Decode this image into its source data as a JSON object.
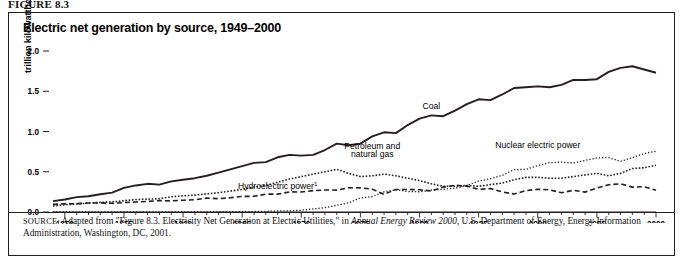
{
  "figure": {
    "label": "FIGURE 8.3",
    "title": "Electric net generation by source, 1949–2000"
  },
  "source": {
    "prefix": "SOURCE:",
    "text_before_italic": " Adapted from \"Figure 8.3. Electricity Net Generation at Electric Utilities,\" in ",
    "italic_title": "Annual Energy Review 2000",
    "text_after_italic": ", U.S. Department of Energy, Energy Information Administration, Washington, DC, 2001."
  },
  "chart_data": {
    "type": "line",
    "title": "Electric net generation by source, 1949–2000",
    "xlabel": "",
    "ylabel": "trillion kilowatthours",
    "xlim": [
      1949,
      2000
    ],
    "ylim": [
      0.0,
      2.0
    ],
    "xticks": [
      1950,
      1955,
      1960,
      1965,
      1970,
      1975,
      1980,
      1985,
      1990,
      1995,
      2000
    ],
    "xtick_labels": [
      "1950",
      "1955",
      "1960",
      "1965",
      "1970",
      "1975",
      "1980",
      "1985",
      "1990",
      "1995",
      "2000"
    ],
    "minor_tick_interval": 1,
    "yticks": [
      0.0,
      0.5,
      1.0,
      1.5,
      2.0
    ],
    "ytick_labels": [
      "0.0",
      "0.5",
      "1.0",
      "1.5",
      "2.0"
    ],
    "grid": false,
    "legend_position": "inline-annotations",
    "footnote_marker": "1",
    "x": [
      1949,
      1950,
      1951,
      1952,
      1953,
      1954,
      1955,
      1956,
      1957,
      1958,
      1959,
      1960,
      1961,
      1962,
      1963,
      1964,
      1965,
      1966,
      1967,
      1968,
      1969,
      1970,
      1971,
      1972,
      1973,
      1974,
      1975,
      1976,
      1977,
      1978,
      1979,
      1980,
      1981,
      1982,
      1983,
      1984,
      1985,
      1986,
      1987,
      1988,
      1989,
      1990,
      1991,
      1992,
      1993,
      1994,
      1995,
      1996,
      1997,
      1998,
      1999,
      2000
    ],
    "series": [
      {
        "name": "Coal",
        "label": "Coal",
        "line_style": "solid",
        "color": "#231f20",
        "values": [
          0.135,
          0.155,
          0.185,
          0.195,
          0.22,
          0.24,
          0.3,
          0.33,
          0.35,
          0.34,
          0.38,
          0.4,
          0.42,
          0.45,
          0.49,
          0.53,
          0.57,
          0.61,
          0.62,
          0.68,
          0.71,
          0.7,
          0.71,
          0.77,
          0.85,
          0.83,
          0.85,
          0.94,
          0.99,
          0.98,
          1.08,
          1.16,
          1.2,
          1.19,
          1.26,
          1.34,
          1.4,
          1.39,
          1.46,
          1.54,
          1.55,
          1.56,
          1.55,
          1.58,
          1.64,
          1.64,
          1.65,
          1.74,
          1.79,
          1.81,
          1.77,
          1.73
        ]
      },
      {
        "name": "Petroleum and natural gas",
        "label": "Petroleum and natural gas",
        "line_style": "dotted",
        "color": "#231f20",
        "values": [
          0.075,
          0.09,
          0.1,
          0.11,
          0.12,
          0.125,
          0.14,
          0.155,
          0.16,
          0.165,
          0.19,
          0.2,
          0.21,
          0.225,
          0.24,
          0.26,
          0.28,
          0.31,
          0.33,
          0.37,
          0.41,
          0.44,
          0.47,
          0.5,
          0.53,
          0.48,
          0.44,
          0.45,
          0.47,
          0.45,
          0.42,
          0.39,
          0.35,
          0.32,
          0.32,
          0.33,
          0.32,
          0.34,
          0.36,
          0.4,
          0.43,
          0.43,
          0.42,
          0.42,
          0.44,
          0.46,
          0.48,
          0.45,
          0.48,
          0.54,
          0.55,
          0.58
        ]
      },
      {
        "name": "Hydroelectric power",
        "label": "Hydroelectric power",
        "line_style": "dashed",
        "color": "#231f20",
        "values": [
          0.095,
          0.101,
          0.104,
          0.111,
          0.113,
          0.108,
          0.117,
          0.125,
          0.131,
          0.142,
          0.138,
          0.146,
          0.153,
          0.172,
          0.166,
          0.177,
          0.194,
          0.195,
          0.222,
          0.222,
          0.25,
          0.248,
          0.266,
          0.273,
          0.272,
          0.301,
          0.3,
          0.284,
          0.22,
          0.28,
          0.28,
          0.276,
          0.261,
          0.309,
          0.332,
          0.321,
          0.281,
          0.291,
          0.25,
          0.223,
          0.266,
          0.283,
          0.276,
          0.24,
          0.269,
          0.247,
          0.297,
          0.339,
          0.35,
          0.309,
          0.314,
          0.271
        ]
      },
      {
        "name": "Nuclear electric power",
        "label": "Nuclear electric power",
        "line_style": "fine-dotted",
        "color": "#231f20",
        "values": [
          0.0,
          0.0,
          0.0,
          0.0,
          0.0,
          0.0,
          0.0,
          0.0,
          0.0,
          0.0,
          0.0,
          0.001,
          0.002,
          0.002,
          0.003,
          0.003,
          0.004,
          0.006,
          0.008,
          0.013,
          0.014,
          0.022,
          0.038,
          0.054,
          0.083,
          0.114,
          0.173,
          0.191,
          0.251,
          0.276,
          0.255,
          0.251,
          0.273,
          0.283,
          0.294,
          0.328,
          0.384,
          0.414,
          0.455,
          0.527,
          0.529,
          0.577,
          0.613,
          0.619,
          0.61,
          0.64,
          0.673,
          0.675,
          0.629,
          0.674,
          0.728,
          0.754
        ]
      }
    ],
    "annotations": [
      {
        "text": "Coal",
        "x": 1981,
        "y": 1.28
      },
      {
        "text": "Petroleum and",
        "x": 1976,
        "y": 0.78
      },
      {
        "text": "natural gas",
        "x": 1976,
        "y": 0.68
      },
      {
        "text": "Hydroelectric power",
        "x": 1968,
        "y": 0.29
      },
      {
        "text": "Nuclear electric power",
        "x": 1990,
        "y": 0.8
      }
    ]
  }
}
